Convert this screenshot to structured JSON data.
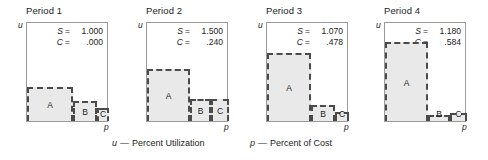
{
  "figure": {
    "captions": [
      {
        "symbol": "u",
        "dash": "—",
        "text": "Percent Utilization"
      },
      {
        "symbol": "p",
        "dash": "—",
        "text": "Percent of Cost"
      }
    ],
    "axis_labels": {
      "y": "u",
      "x": "p"
    },
    "stat_symbols": {
      "s": "S",
      "c": "C",
      "equals": "="
    },
    "panels": [
      {
        "title": "Period 1",
        "s_value": "1.000",
        "c_value": ".000",
        "regions": [
          {
            "label": "A",
            "x": 0,
            "w": 46,
            "h": 34
          },
          {
            "label": "B",
            "x": 46,
            "w": 24,
            "h": 20
          },
          {
            "label": "C",
            "x": 70,
            "w": 12,
            "h": 13
          }
        ]
      },
      {
        "title": "Period 2",
        "s_value": "1.500",
        "c_value": ".240",
        "regions": [
          {
            "label": "A",
            "x": 0,
            "w": 43,
            "h": 52
          },
          {
            "label": "B",
            "x": 43,
            "w": 21,
            "h": 22
          },
          {
            "label": "C",
            "x": 64,
            "w": 18,
            "h": 22
          }
        ]
      },
      {
        "title": "Period 3",
        "s_value": "1.070",
        "c_value": ".478",
        "regions": [
          {
            "label": "A",
            "x": 0,
            "w": 44,
            "h": 68
          },
          {
            "label": "B",
            "x": 44,
            "w": 24,
            "h": 16
          },
          {
            "label": "C",
            "x": 68,
            "w": 14,
            "h": 9
          }
        ]
      },
      {
        "title": "Period 4",
        "s_value": "1.180",
        "c_value": ".584",
        "regions": [
          {
            "label": "A",
            "x": 0,
            "w": 43,
            "h": 79
          },
          {
            "label": "B",
            "x": 43,
            "w": 22,
            "h": 6
          },
          {
            "label": "C",
            "x": 65,
            "w": 17,
            "h": 8
          }
        ]
      }
    ]
  },
  "chart_data": {
    "type": "bar",
    "title": "",
    "xlabel": "p — Percent of Cost",
    "ylabel": "u — Percent Utilization",
    "grid": false,
    "legend": null,
    "note": "Four small multiples. Each panel is a staircase of three stacked-width blocks A, B, C plotted on axes u (percent utilization, vertical) vs p (percent of cost, horizontal). Widths/heights are percentages of the plot frame.",
    "panels": [
      {
        "title": "Period 1",
        "S": 1.0,
        "C": 0.0,
        "categories": [
          "A",
          "B",
          "C"
        ],
        "widths_pct": [
          56,
          29,
          15
        ],
        "heights_pct": [
          34,
          20,
          13
        ]
      },
      {
        "title": "Period 2",
        "S": 1.5,
        "C": 0.24,
        "categories": [
          "A",
          "B",
          "C"
        ],
        "widths_pct": [
          52,
          26,
          22
        ],
        "heights_pct": [
          52,
          22,
          22
        ]
      },
      {
        "title": "Period 3",
        "S": 1.07,
        "C": 0.478,
        "categories": [
          "A",
          "B",
          "C"
        ],
        "widths_pct": [
          54,
          29,
          17
        ],
        "heights_pct": [
          68,
          16,
          9
        ]
      },
      {
        "title": "Period 4",
        "S": 1.18,
        "C": 0.584,
        "categories": [
          "A",
          "B",
          "C"
        ],
        "widths_pct": [
          52,
          27,
          21
        ],
        "heights_pct": [
          79,
          6,
          8
        ]
      }
    ]
  }
}
